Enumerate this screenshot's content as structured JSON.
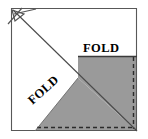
{
  "figure": {
    "labels": {
      "fold_top": "FOLD",
      "fold_diagonal": "FOLD"
    },
    "colors": {
      "shaded_fill": "#9a9a9a",
      "paper_fill": "#ffffff",
      "outline": "#4a4a4a",
      "fold_line": "#3a3a3a",
      "dashed_edge": "#2b2b2b",
      "arrow": "#555555"
    },
    "geometry": {
      "square": {
        "left": 11,
        "top": 8,
        "right": 137,
        "bottom": 131
      },
      "horizontal_fold_y": 57,
      "apex": {
        "x": 78,
        "y": 78
      },
      "diagonal_from": {
        "x": 13,
        "y": 10
      },
      "diagonal_to": {
        "x": 137,
        "y": 131
      }
    },
    "annotations": {
      "arrow_target": "top-left-corner",
      "dashed_edges": [
        "right",
        "bottom"
      ]
    }
  }
}
